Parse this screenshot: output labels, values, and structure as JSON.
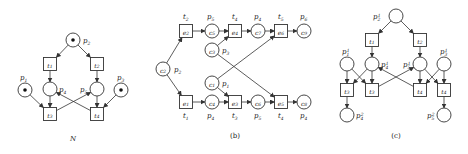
{
  "panels": [
    {
      "id": "N",
      "caption": "N",
      "places": [
        {
          "id": "p2",
          "x": 73,
          "y": 40,
          "label": "p2",
          "lx": 83,
          "ly": 43,
          "token": true
        },
        {
          "id": "p1",
          "x": 25,
          "y": 90,
          "label": "p1",
          "lx": 20,
          "ly": 80,
          "token": true
        },
        {
          "id": "p4",
          "x": 50,
          "y": 89,
          "label": "p4",
          "lx": 59,
          "ly": 92,
          "token": false
        },
        {
          "id": "p5",
          "x": 97,
          "y": 89,
          "label": "p5",
          "lx": 80,
          "ly": 92,
          "token": false
        },
        {
          "id": "p3",
          "x": 121,
          "y": 90,
          "label": "p3",
          "lx": 117,
          "ly": 80,
          "token": true
        }
      ],
      "transitions": [
        {
          "id": "t1",
          "x": 50,
          "y": 64,
          "label": "t1"
        },
        {
          "id": "t2",
          "x": 97,
          "y": 64,
          "label": "t2"
        },
        {
          "id": "t3",
          "x": 50,
          "y": 114,
          "label": "t3"
        },
        {
          "id": "t4",
          "x": 97,
          "y": 114,
          "label": "t4"
        }
      ],
      "arcs": [
        [
          "p2",
          "t1"
        ],
        [
          "p2",
          "t2"
        ],
        [
          "t1",
          "p4"
        ],
        [
          "t2",
          "p5"
        ],
        [
          "p1",
          "t3"
        ],
        [
          "p4",
          "t3"
        ],
        [
          "p3",
          "t4"
        ],
        [
          "p5",
          "t4"
        ],
        [
          "t3",
          "p5"
        ],
        [
          "t4",
          "p4"
        ]
      ]
    },
    {
      "id": "b",
      "caption": "(b)",
      "places": [
        {
          "id": "c2",
          "x": 163,
          "y": 69,
          "label": "c2",
          "outer": "p2",
          "lx": 174,
          "ly": 72
        },
        {
          "id": "c5",
          "x": 212,
          "y": 31,
          "label": "c5",
          "outer": "p5",
          "lx": 207,
          "ly": 19
        },
        {
          "id": "c3",
          "x": 212,
          "y": 50,
          "label": "c3",
          "outer": "p3",
          "lx": 222,
          "ly": 53
        },
        {
          "id": "c7",
          "x": 258,
          "y": 31,
          "label": "c7",
          "outer": "p4",
          "lx": 254,
          "ly": 19
        },
        {
          "id": "c9",
          "x": 304,
          "y": 31,
          "label": "c9",
          "outer": "p6",
          "lx": 300,
          "ly": 19
        },
        {
          "id": "c1",
          "x": 212,
          "y": 83,
          "label": "c1",
          "outer": "p1",
          "lx": 222,
          "ly": 86
        },
        {
          "id": "c4",
          "x": 212,
          "y": 102,
          "label": "c4",
          "outer": "p4",
          "lx": 207,
          "ly": 118
        },
        {
          "id": "c6",
          "x": 258,
          "y": 102,
          "label": "c6",
          "outer": "p5",
          "lx": 254,
          "ly": 118
        },
        {
          "id": "c8",
          "x": 304,
          "y": 102,
          "label": "c8",
          "outer": "p4",
          "lx": 300,
          "ly": 118
        }
      ],
      "transitions": [
        {
          "id": "e2",
          "x": 186,
          "y": 31,
          "label": "e2",
          "outer": "t2",
          "lx": 183,
          "ly": 19
        },
        {
          "id": "e4",
          "x": 235,
          "y": 31,
          "label": "e4",
          "outer": "t4",
          "lx": 232,
          "ly": 19
        },
        {
          "id": "e6",
          "x": 281,
          "y": 31,
          "label": "e6",
          "outer": "t5",
          "lx": 278,
          "ly": 19
        },
        {
          "id": "e1",
          "x": 186,
          "y": 102,
          "label": "e1",
          "outer": "t1",
          "lx": 183,
          "ly": 118
        },
        {
          "id": "e3",
          "x": 235,
          "y": 102,
          "label": "e3",
          "outer": "t3",
          "lx": 232,
          "ly": 118
        },
        {
          "id": "e5",
          "x": 281,
          "y": 102,
          "label": "e5",
          "outer": "t4",
          "lx": 278,
          "ly": 118
        }
      ],
      "arcs": [
        [
          "c2",
          "e2"
        ],
        [
          "c2",
          "e1"
        ],
        [
          "e2",
          "c5"
        ],
        [
          "c5",
          "e4"
        ],
        [
          "c3",
          "e4"
        ],
        [
          "e4",
          "c7"
        ],
        [
          "c7",
          "e6"
        ],
        [
          "e6",
          "c9"
        ],
        [
          "c1",
          "e6"
        ],
        [
          "e1",
          "c4"
        ],
        [
          "c4",
          "e3"
        ],
        [
          "c1",
          "e3"
        ],
        [
          "e3",
          "c6"
        ],
        [
          "c6",
          "e5"
        ],
        [
          "c3",
          "e5"
        ],
        [
          "e5",
          "c8"
        ]
      ]
    },
    {
      "id": "c",
      "caption": "(c)",
      "places": [
        {
          "id": "p21",
          "x": 396,
          "y": 16,
          "label": "p2^1",
          "lx": 373,
          "ly": 19
        },
        {
          "id": "p11",
          "x": 347,
          "y": 64,
          "label": "p1^1",
          "lx": 342,
          "ly": 54
        },
        {
          "id": "p41",
          "x": 372,
          "y": 64,
          "label": "p4^1",
          "lx": 381,
          "ly": 67
        },
        {
          "id": "p51",
          "x": 420,
          "y": 64,
          "label": "p5^1",
          "lx": 403,
          "ly": 67
        },
        {
          "id": "p31",
          "x": 444,
          "y": 64,
          "label": "p3^1",
          "lx": 440,
          "ly": 54
        },
        {
          "id": "p42",
          "x": 347,
          "y": 115,
          "label": "p4^2",
          "lx": 356,
          "ly": 118
        },
        {
          "id": "p52",
          "x": 444,
          "y": 115,
          "label": "p5^2",
          "lx": 427,
          "ly": 118
        }
      ],
      "transitions": [
        {
          "id": "t1c",
          "x": 372,
          "y": 40,
          "label": "t1"
        },
        {
          "id": "t2c",
          "x": 420,
          "y": 40,
          "label": "t2"
        },
        {
          "id": "t3a",
          "x": 347,
          "y": 90,
          "label": "t3"
        },
        {
          "id": "t3b",
          "x": 372,
          "y": 90,
          "label": "t3"
        },
        {
          "id": "t4a",
          "x": 420,
          "y": 90,
          "label": "t4"
        },
        {
          "id": "t4b",
          "x": 444,
          "y": 90,
          "label": "t4"
        }
      ],
      "arcs": [
        [
          "p21",
          "t1c"
        ],
        [
          "p21",
          "t2c"
        ],
        [
          "t1c",
          "p41"
        ],
        [
          "t2c",
          "p51"
        ],
        [
          "p11",
          "t3a"
        ],
        [
          "p11",
          "t3b"
        ],
        [
          "p41",
          "t3a"
        ],
        [
          "p41",
          "t3b"
        ],
        [
          "p51",
          "t4a"
        ],
        [
          "p51",
          "t4b"
        ],
        [
          "p31",
          "t4a"
        ],
        [
          "p31",
          "t4b"
        ],
        [
          "t3a",
          "p42"
        ],
        [
          "t4b",
          "p52"
        ],
        [
          "t3b",
          "p51"
        ],
        [
          "t4a",
          "p41"
        ]
      ]
    }
  ],
  "captions": [
    {
      "text": "N",
      "x": 73,
      "y": 141,
      "italic": true
    },
    {
      "text": "(b)",
      "x": 235,
      "y": 138,
      "italic": false
    },
    {
      "text": "(c)",
      "x": 396,
      "y": 138,
      "italic": false
    }
  ]
}
